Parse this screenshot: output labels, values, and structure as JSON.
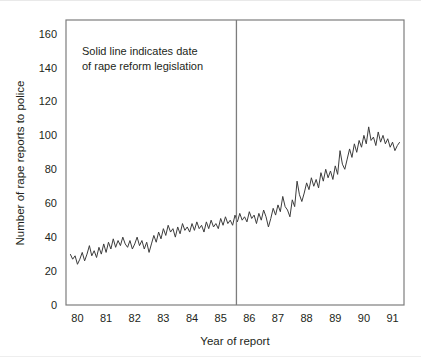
{
  "chart_data": {
    "type": "line",
    "title": "",
    "xlabel": "Year of report",
    "ylabel": "Number of rape reports to police",
    "xlim": [
      1979.6,
      1991.4
    ],
    "ylim": [
      0,
      168
    ],
    "grid": false,
    "legend": null,
    "ytick_labels": [
      "0",
      "20",
      "40",
      "60",
      "80",
      "100",
      "120",
      "140",
      "160"
    ],
    "ytick_values": [
      0,
      20,
      40,
      60,
      80,
      100,
      120,
      140,
      160
    ],
    "xtick_labels": [
      "80",
      "81",
      "82",
      "83",
      "84",
      "85",
      "86",
      "87",
      "88",
      "89",
      "90",
      "91"
    ],
    "xtick_values": [
      1980,
      1981,
      1982,
      1983,
      1984,
      1985,
      1986,
      1987,
      1988,
      1989,
      1990,
      1991
    ],
    "annotations": [
      {
        "name": "reform-note",
        "line1": "Solid line indicates date",
        "line2": "of rape reform legislation",
        "x": 1980.35,
        "y": 152
      }
    ],
    "reference_lines": [
      {
        "name": "rape-reform-legislation-date",
        "orientation": "vertical",
        "x": 1985.55,
        "color": "#7d7d7d"
      }
    ],
    "series": [
      {
        "name": "Monthly rape reports to police",
        "color": "#3c3c3c",
        "x": [
          1979.75,
          1979.833,
          1979.917,
          1980.0,
          1980.083,
          1980.167,
          1980.25,
          1980.333,
          1980.417,
          1980.5,
          1980.583,
          1980.667,
          1980.75,
          1980.833,
          1980.917,
          1981.0,
          1981.083,
          1981.167,
          1981.25,
          1981.333,
          1981.417,
          1981.5,
          1981.583,
          1981.667,
          1981.75,
          1981.833,
          1981.917,
          1982.0,
          1982.083,
          1982.167,
          1982.25,
          1982.333,
          1982.417,
          1982.5,
          1982.583,
          1982.667,
          1982.75,
          1982.833,
          1982.917,
          1983.0,
          1983.083,
          1983.167,
          1983.25,
          1983.333,
          1983.417,
          1983.5,
          1983.583,
          1983.667,
          1983.75,
          1983.833,
          1983.917,
          1984.0,
          1984.083,
          1984.167,
          1984.25,
          1984.333,
          1984.417,
          1984.5,
          1984.583,
          1984.667,
          1984.75,
          1984.833,
          1984.917,
          1985.0,
          1985.083,
          1985.167,
          1985.25,
          1985.333,
          1985.417,
          1985.5,
          1985.583,
          1985.667,
          1985.75,
          1985.833,
          1985.917,
          1986.0,
          1986.083,
          1986.167,
          1986.25,
          1986.333,
          1986.417,
          1986.5,
          1986.583,
          1986.667,
          1986.75,
          1986.833,
          1986.917,
          1987.0,
          1987.083,
          1987.167,
          1987.25,
          1987.333,
          1987.417,
          1987.5,
          1987.583,
          1987.667,
          1987.75,
          1987.833,
          1987.917,
          1988.0,
          1988.083,
          1988.167,
          1988.25,
          1988.333,
          1988.417,
          1988.5,
          1988.583,
          1988.667,
          1988.75,
          1988.833,
          1988.917,
          1989.0,
          1989.083,
          1989.167,
          1989.25,
          1989.333,
          1989.417,
          1989.5,
          1989.583,
          1989.667,
          1989.75,
          1989.833,
          1989.917,
          1990.0,
          1990.083,
          1990.167,
          1990.25,
          1990.333,
          1990.417,
          1990.5,
          1990.583,
          1990.667,
          1990.75,
          1990.833,
          1990.917,
          1991.0,
          1991.083,
          1991.167,
          1991.25
        ],
        "values": [
          30,
          27,
          29,
          24,
          27,
          31,
          26,
          30,
          35,
          29,
          32,
          28,
          34,
          30,
          36,
          31,
          37,
          33,
          39,
          34,
          38,
          35,
          40,
          36,
          34,
          38,
          33,
          36,
          40,
          35,
          38,
          33,
          37,
          31,
          36,
          41,
          37,
          43,
          39,
          45,
          41,
          47,
          43,
          45,
          40,
          46,
          42,
          48,
          44,
          46,
          43,
          48,
          44,
          49,
          45,
          47,
          43,
          49,
          45,
          50,
          46,
          48,
          45,
          51,
          47,
          52,
          48,
          50,
          47,
          53,
          49,
          54,
          50,
          52,
          49,
          55,
          51,
          53,
          48,
          54,
          50,
          56,
          52,
          46,
          51,
          57,
          53,
          59,
          55,
          64,
          58,
          56,
          52,
          62,
          58,
          73,
          65,
          61,
          66,
          72,
          68,
          75,
          70,
          74,
          69,
          78,
          73,
          80,
          75,
          79,
          74,
          82,
          77,
          91,
          83,
          80,
          86,
          92,
          87,
          95,
          90,
          97,
          93,
          100,
          95,
          105,
          97,
          99,
          94,
          102,
          96,
          100,
          95,
          98,
          93,
          96,
          91,
          94,
          96
        ]
      }
    ]
  }
}
